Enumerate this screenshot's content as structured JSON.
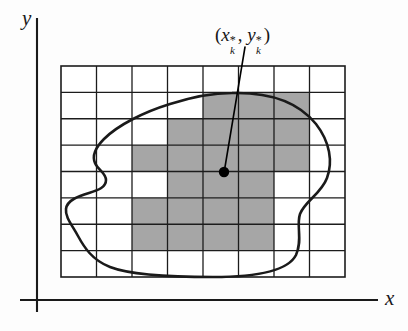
{
  "figure": {
    "axes": {
      "y_label": "y",
      "x_label": "x",
      "y_axis_x": 37,
      "y_axis_top": 18,
      "y_axis_bottom": 312,
      "x_axis_y": 300,
      "x_axis_left": 20,
      "x_axis_right": 378,
      "axis_color": "#1a1a1a"
    },
    "point_label": {
      "open_paren": "(",
      "x_var": "x",
      "x_sup": "*",
      "x_sub": "k",
      "comma": ", ",
      "y_var": "y",
      "y_sup": "*",
      "y_sub": "k",
      "close_paren": ")",
      "text": "(x*k, y*k)"
    },
    "sample_point": {
      "cx": 224,
      "cy": 172,
      "r": 5.2,
      "color": "#000000"
    },
    "leader_line": {
      "x1": 245,
      "y1": 47,
      "x2": 224.5,
      "y2": 170,
      "color": "#000000",
      "width": 1.6
    },
    "grid": {
      "x0": 61,
      "y0": 66,
      "x1": 345,
      "y1": 277,
      "cols": 8,
      "rows": 8,
      "line_color": "#1c1c1c",
      "line_width": 1.3,
      "border_width": 1.6,
      "fill": "#ffffff"
    },
    "shading": {
      "color": "#a6a6a6",
      "cells": [
        [
          4,
          1
        ],
        [
          5,
          1
        ],
        [
          6,
          1
        ],
        [
          3,
          2
        ],
        [
          4,
          2
        ],
        [
          5,
          2
        ],
        [
          6,
          2
        ],
        [
          2,
          3
        ],
        [
          3,
          3
        ],
        [
          4,
          3
        ],
        [
          5,
          3
        ],
        [
          6,
          3
        ],
        [
          3,
          4
        ],
        [
          4,
          4
        ],
        [
          5,
          4
        ],
        [
          2,
          5
        ],
        [
          3,
          5
        ],
        [
          4,
          5
        ],
        [
          5,
          5
        ],
        [
          2,
          6
        ],
        [
          3,
          6
        ],
        [
          4,
          6
        ],
        [
          5,
          6
        ]
      ]
    },
    "region_curve": {
      "color": "#1a1a1a",
      "width": 2.6,
      "path": "M 232 93 C 272 92 300 104 316 124 C 330 142 333 162 327 178 C 321 194 305 201 300 214 C 296 226 303 240 296 255 C 288 271 258 277 213 277 C 168 277 128 274 110 267 C 92 260 84 247 78 236 C 72 225 65 217 66 209 C 67 200 79 196 89 193 C 99 190 106 187 106 180 C 106 173 98 170 95 163 C 92 156 95 148 104 139 C 118 125 144 112 170 104 C 192 97 212 93 232 93 Z"
    }
  }
}
